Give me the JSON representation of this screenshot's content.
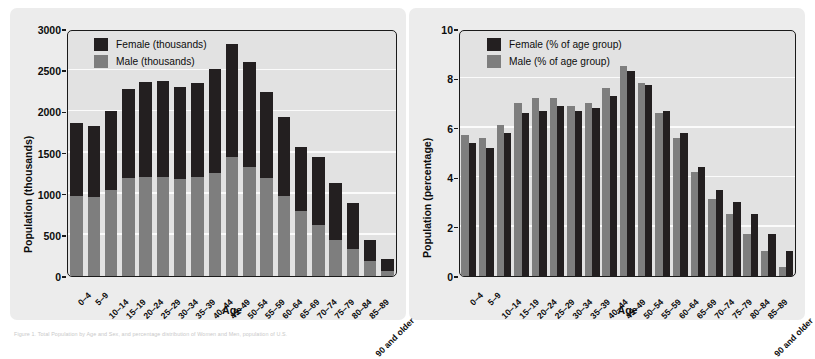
{
  "figure": {
    "background_color": "#ffffff",
    "panel_background_color": "#ececec",
    "plot_background_color": "#e2e2e2",
    "caption": "Figure 1. Total Population by Age and Sex, and percentage distribution of Women and Men, population of U.S."
  },
  "colors": {
    "female": "#231f20",
    "male": "#7e7e7e",
    "axis": "#1a1a1a",
    "gridline": "#fbfbfb"
  },
  "chart_data": [
    {
      "id": "left",
      "type": "bar",
      "stacked": true,
      "title": "",
      "xlabel": "Age",
      "ylabel": "Population (thousands)",
      "ylim": [
        0,
        3000
      ],
      "yticks": [
        0,
        500,
        1000,
        1500,
        2000,
        2500,
        3000
      ],
      "ytick_labels": [
        "0",
        "500",
        "1000",
        "1500",
        "2000",
        "2500",
        "3000"
      ],
      "grid": true,
      "legend_position": "upper-left",
      "categories": [
        "0–4",
        "5–9",
        "10–14",
        "15–19",
        "20–24",
        "25–29",
        "30–34",
        "35–39",
        "40–44",
        "45–49",
        "50–54",
        "55–59",
        "60–64",
        "65–69",
        "70–74",
        "75–79",
        "80–84",
        "85–89",
        "90 and older"
      ],
      "series": [
        {
          "name": "Male (thousands)",
          "color": "#7e7e7e",
          "values": [
            975,
            965,
            1045,
            1195,
            1200,
            1200,
            1180,
            1200,
            1250,
            1440,
            1330,
            1190,
            975,
            790,
            620,
            440,
            325,
            185,
            60
          ]
        },
        {
          "name": "Female (thousands)",
          "color": "#231f20",
          "values": [
            880,
            855,
            955,
            1080,
            1160,
            1170,
            1120,
            1140,
            1260,
            1375,
            1270,
            1045,
            960,
            780,
            820,
            690,
            560,
            250,
            145
          ]
        }
      ],
      "totals": [
        1855,
        1820,
        2000,
        2275,
        2360,
        2370,
        2300,
        2340,
        2510,
        2815,
        2600,
        2235,
        1935,
        1570,
        1440,
        1130,
        885,
        435,
        205
      ]
    },
    {
      "id": "right",
      "type": "bar",
      "stacked": false,
      "title": "",
      "xlabel": "Age",
      "ylabel": "Population (percentage)",
      "ylim": [
        0,
        10
      ],
      "yticks": [
        0,
        2,
        4,
        6,
        8,
        10
      ],
      "ytick_labels": [
        "0",
        "2",
        "4",
        "6",
        "8",
        "10"
      ],
      "grid": true,
      "legend_position": "upper-left",
      "categories": [
        "0–4",
        "5–9",
        "10–14",
        "15–19",
        "20–24",
        "25–29",
        "30–34",
        "35–39",
        "40–44",
        "45–49",
        "50–54",
        "55–59",
        "60–64",
        "65–69",
        "70–74",
        "75–79",
        "80–84",
        "85–89",
        "90 and older"
      ],
      "series": [
        {
          "name": "Male (% of age group)",
          "color": "#7e7e7e",
          "values": [
            5.7,
            5.6,
            6.1,
            7.0,
            7.2,
            7.2,
            6.9,
            7.0,
            7.6,
            8.5,
            7.8,
            6.6,
            5.6,
            4.2,
            3.1,
            2.5,
            1.7,
            1.0,
            0.35
          ]
        },
        {
          "name": "Female (% of age group)",
          "color": "#231f20",
          "values": [
            5.4,
            5.2,
            5.8,
            6.6,
            6.7,
            6.9,
            6.7,
            6.8,
            7.3,
            8.3,
            7.75,
            6.7,
            5.8,
            4.4,
            3.5,
            3.0,
            2.5,
            1.7,
            1.0
          ]
        }
      ]
    }
  ]
}
